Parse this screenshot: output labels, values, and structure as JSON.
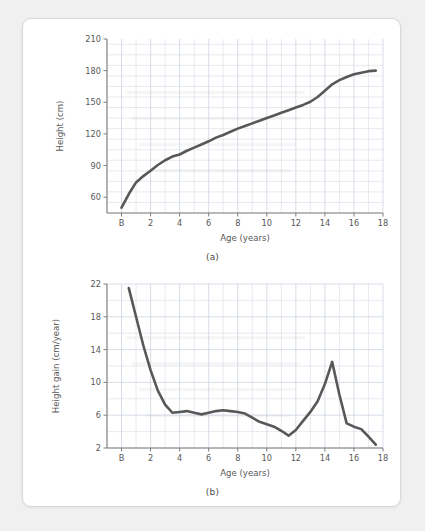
{
  "figure": {
    "background_color": "#f0f0f0",
    "card_color": "#ffffff",
    "line_color": "#585858",
    "grid_color": "#d6dce6"
  },
  "panel_a": {
    "caption": "(a)",
    "xlabel": "Age (years)",
    "ylabel": "Height (cm)"
  },
  "panel_b": {
    "caption": "(b)",
    "xlabel": "Age (years)",
    "ylabel": "Height gain (cm/year)"
  },
  "chart_data": [
    {
      "id": "panel-a",
      "type": "line",
      "title": "",
      "caption": "(a)",
      "xlabel": "Age (years)",
      "ylabel": "Height (cm)",
      "xlim": [
        -1,
        18
      ],
      "ylim": [
        45,
        210
      ],
      "xticks": [
        0,
        2,
        4,
        6,
        8,
        10,
        12,
        14,
        16,
        18
      ],
      "xticklabels": [
        "B",
        "2",
        "4",
        "6",
        "8",
        "10",
        "12",
        "14",
        "16",
        "18"
      ],
      "yticks": [
        60,
        90,
        120,
        150,
        180,
        210
      ],
      "yticklabels": [
        "60",
        "90",
        "120",
        "150",
        "180",
        "210"
      ],
      "x_minor_step": 1,
      "y_minor_step": 10,
      "grid": true,
      "legend": null,
      "series": [
        {
          "name": "Height",
          "units": "cm",
          "x": [
            0.0,
            0.5,
            1.0,
            1.5,
            2.0,
            2.5,
            3.0,
            3.5,
            4.0,
            4.5,
            5.0,
            5.5,
            6.0,
            6.5,
            7.0,
            7.5,
            8.0,
            8.5,
            9.0,
            9.5,
            10.0,
            10.5,
            11.0,
            11.5,
            12.0,
            12.5,
            13.0,
            13.5,
            14.0,
            14.5,
            15.0,
            15.5,
            16.0,
            16.5,
            17.0,
            17.5
          ],
          "y": [
            50.0,
            63.0,
            74.0,
            80.0,
            85.0,
            90.5,
            95.0,
            98.5,
            100.5,
            104.0,
            107.0,
            110.0,
            113.0,
            116.5,
            119.0,
            122.0,
            125.0,
            127.5,
            130.0,
            132.5,
            135.0,
            137.5,
            140.0,
            142.5,
            145.0,
            147.5,
            150.5,
            155.0,
            161.0,
            167.0,
            171.0,
            174.0,
            176.5,
            178.0,
            179.5,
            180.0
          ]
        }
      ]
    },
    {
      "id": "panel-b",
      "type": "line",
      "title": "",
      "caption": "(b)",
      "xlabel": "Age (years)",
      "ylabel": "Height gain (cm/year)",
      "xlim": [
        -1,
        18
      ],
      "ylim": [
        2,
        22
      ],
      "xticks": [
        0,
        2,
        4,
        6,
        8,
        10,
        12,
        14,
        16,
        18
      ],
      "xticklabels": [
        "B",
        "2",
        "4",
        "6",
        "8",
        "10",
        "12",
        "14",
        "16",
        "18"
      ],
      "yticks": [
        2,
        6,
        10,
        14,
        18,
        22
      ],
      "yticklabels": [
        "2",
        "6",
        "10",
        "14",
        "18",
        "22"
      ],
      "x_minor_step": 1,
      "y_minor_step": 2,
      "grid": true,
      "legend": null,
      "series": [
        {
          "name": "Height gain",
          "units": "cm/year",
          "x": [
            0.5,
            1.0,
            1.5,
            2.0,
            2.5,
            3.0,
            3.5,
            4.0,
            4.5,
            5.0,
            5.5,
            6.0,
            6.5,
            7.0,
            7.5,
            8.0,
            8.5,
            9.0,
            9.5,
            10.0,
            10.5,
            11.0,
            11.5,
            12.0,
            12.5,
            13.0,
            13.5,
            14.0,
            14.5,
            15.0,
            15.5,
            16.0,
            16.5,
            17.0,
            17.5
          ],
          "y": [
            21.5,
            18.0,
            14.5,
            11.5,
            9.0,
            7.3,
            6.3,
            6.4,
            6.5,
            6.3,
            6.1,
            6.3,
            6.5,
            6.6,
            6.5,
            6.4,
            6.2,
            5.7,
            5.2,
            4.9,
            4.6,
            4.1,
            3.5,
            4.2,
            5.3,
            6.4,
            7.7,
            9.8,
            12.5,
            8.5,
            5.0,
            4.6,
            4.3,
            3.4,
            2.4
          ]
        }
      ]
    }
  ]
}
